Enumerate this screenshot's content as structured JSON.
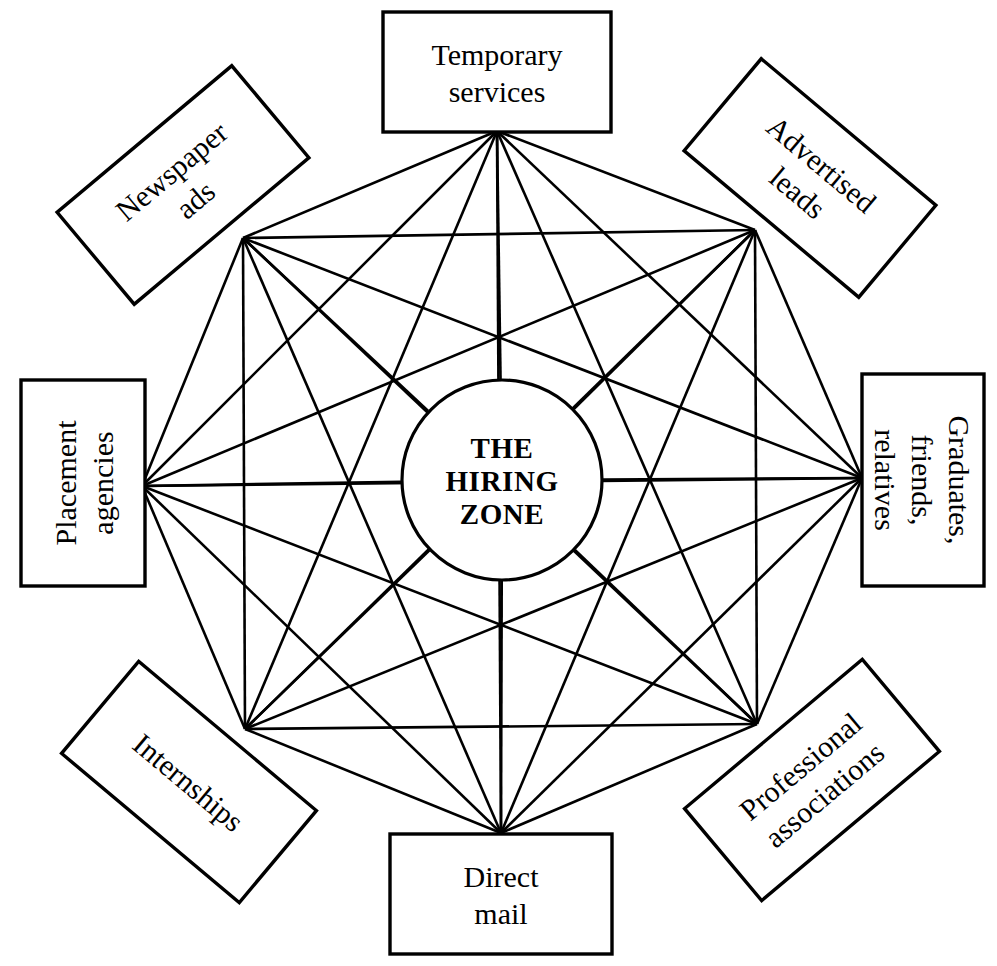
{
  "diagram": {
    "hub": {
      "name": "hiring-zone-hub",
      "lines": [
        "THE",
        "HIRING",
        "ZONE"
      ],
      "cx": 502,
      "cy": 480,
      "r": 100
    },
    "style": {
      "background": "#ffffff",
      "line_color": "#000000",
      "box_fill": "#ffffff",
      "box_stroke": "#000000"
    },
    "nodes": [
      {
        "id": "temporary-services",
        "lines": [
          "Temporary",
          "services"
        ],
        "node_x": 497,
        "node_y": 131,
        "box_cx": 497,
        "box_cy": 72,
        "box_w": 228,
        "box_h": 120,
        "rotation": 0
      },
      {
        "id": "newspaper-ads",
        "lines": [
          "Newspaper",
          "ads"
        ],
        "node_x": 243,
        "node_y": 238,
        "box_cx": 183,
        "box_cy": 185,
        "box_w": 228,
        "box_h": 120,
        "rotation": -40
      },
      {
        "id": "advertised-leads",
        "lines": [
          "Advertised",
          "leads"
        ],
        "node_x": 755,
        "node_y": 230,
        "box_cx": 810,
        "box_cy": 178,
        "box_w": 228,
        "box_h": 120,
        "rotation": 40
      },
      {
        "id": "placement-agencies",
        "lines": [
          "Placement",
          "agencies"
        ],
        "node_x": 142,
        "node_y": 486,
        "box_cx": 83,
        "box_cy": 483,
        "box_w": 206,
        "box_h": 124,
        "rotation": -90
      },
      {
        "id": "graduates-friends-relatives",
        "lines": [
          "Graduates,",
          "friends,",
          "relatives"
        ],
        "node_x": 862,
        "node_y": 478,
        "box_cx": 923,
        "box_cy": 480,
        "box_w": 212,
        "box_h": 122,
        "rotation": 90
      },
      {
        "id": "internships",
        "lines": [
          "Internships"
        ],
        "node_x": 245,
        "node_y": 729,
        "box_cx": 189,
        "box_cy": 782,
        "box_w": 232,
        "box_h": 120,
        "rotation": 40
      },
      {
        "id": "professional-associations",
        "lines": [
          "Professional",
          "associations"
        ],
        "node_x": 757,
        "node_y": 724,
        "box_cx": 812,
        "box_cy": 780,
        "box_w": 232,
        "box_h": 120,
        "rotation": -40
      },
      {
        "id": "direct-mail",
        "lines": [
          "Direct",
          "mail"
        ],
        "node_x": 501,
        "node_y": 833,
        "box_cx": 501,
        "box_cy": 894,
        "box_w": 222,
        "box_h": 120,
        "rotation": 0
      }
    ]
  }
}
